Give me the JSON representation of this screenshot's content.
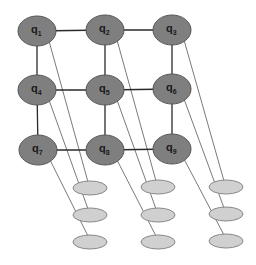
{
  "diagram": {
    "title": "",
    "colors": {
      "node_fill": "#7f7f7f",
      "node_stroke": "#555555",
      "ghost_fill": "#d0d0d0",
      "ghost_stroke": "#888888",
      "grid_edge": "#2a2a2a",
      "link_edge": "#7a7a7a"
    },
    "nodes": [
      {
        "id": "q1",
        "base": "q",
        "sub": "1",
        "x": 37,
        "y": 31
      },
      {
        "id": "q2",
        "base": "q",
        "sub": "2",
        "x": 105,
        "y": 30
      },
      {
        "id": "q3",
        "base": "q",
        "sub": "3",
        "x": 172,
        "y": 30
      },
      {
        "id": "q4",
        "base": "q",
        "sub": "4",
        "x": 37,
        "y": 90
      },
      {
        "id": "q5",
        "base": "q",
        "sub": "5",
        "x": 105,
        "y": 90
      },
      {
        "id": "q6",
        "base": "q",
        "sub": "6",
        "x": 172,
        "y": 89
      },
      {
        "id": "q7",
        "base": "q",
        "sub": "7",
        "x": 38,
        "y": 150
      },
      {
        "id": "q8",
        "base": "q",
        "sub": "8",
        "x": 105,
        "y": 150
      },
      {
        "id": "q9",
        "base": "q",
        "sub": "9",
        "x": 172,
        "y": 149
      }
    ],
    "grid_edges": [
      [
        "q1",
        "q2"
      ],
      [
        "q2",
        "q3"
      ],
      [
        "q4",
        "q5"
      ],
      [
        "q5",
        "q6"
      ],
      [
        "q7",
        "q8"
      ],
      [
        "q8",
        "q9"
      ],
      [
        "q1",
        "q4"
      ],
      [
        "q4",
        "q7"
      ],
      [
        "q2",
        "q5"
      ],
      [
        "q5",
        "q8"
      ],
      [
        "q3",
        "q6"
      ],
      [
        "q6",
        "q9"
      ]
    ],
    "ghost_nodes": [
      {
        "id": "g1",
        "x": 90,
        "y": 188,
        "source": "q1"
      },
      {
        "id": "g2",
        "x": 158,
        "y": 187,
        "source": "q2"
      },
      {
        "id": "g3",
        "x": 226,
        "y": 187,
        "source": "q3"
      },
      {
        "id": "g4",
        "x": 90,
        "y": 215,
        "source": "q4"
      },
      {
        "id": "g5",
        "x": 158,
        "y": 215,
        "source": "q5"
      },
      {
        "id": "g6",
        "x": 226,
        "y": 214,
        "source": "q6"
      },
      {
        "id": "g7",
        "x": 90,
        "y": 242,
        "source": "q7"
      },
      {
        "id": "g8",
        "x": 158,
        "y": 242,
        "source": "q8"
      },
      {
        "id": "g9",
        "x": 226,
        "y": 241,
        "source": "q9"
      }
    ]
  }
}
